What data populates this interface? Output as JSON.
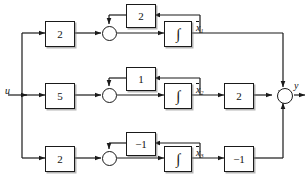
{
  "diagram": {
    "input": {
      "label": "u"
    },
    "output": {
      "label": "y"
    },
    "stroke_color": "#1a1a1a",
    "background": "#ffffff",
    "channels": [
      {
        "id": "channel-1",
        "input_gain": "2",
        "feedback_gain": "2",
        "integrator": "∫",
        "state_label": "x",
        "state_subscript": "1",
        "output_gain": null
      },
      {
        "id": "channel-2",
        "input_gain": "5",
        "feedback_gain": "1",
        "integrator": "∫",
        "state_label": "x",
        "state_subscript": "2",
        "output_gain": "2"
      },
      {
        "id": "channel-3",
        "input_gain": "2",
        "feedback_gain": "−1",
        "integrator": "∫",
        "state_label": "x",
        "state_subscript": "3",
        "output_gain": "−1"
      }
    ],
    "summing_junction_symbol": "⊗"
  }
}
